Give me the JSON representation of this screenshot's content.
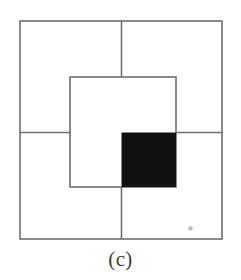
{
  "figure": {
    "caption": "(c)",
    "background_color": "#ffffff",
    "line_color": "#6e6e6e",
    "fill_color": "#111111",
    "dot_color": "#b8b8b8",
    "line_width": 1.6,
    "outer_square": {
      "name": "outer-square",
      "x": 20,
      "y": 21,
      "width": 202,
      "height": 218
    },
    "cross_lines": [
      {
        "name": "vertical-divider",
        "orientation": "vertical",
        "x": 121.5,
        "y1": 21,
        "y2": 239
      },
      {
        "name": "horizontal-divider",
        "orientation": "horizontal",
        "y": 132.5,
        "x1": 20,
        "x2": 222
      }
    ],
    "inner_square": {
      "name": "inner-square",
      "x": 70,
      "y": 77,
      "width": 106,
      "height": 110
    },
    "filled_square": {
      "name": "filled-square",
      "x": 121.5,
      "y": 132.5,
      "width": 54.5,
      "height": 54.5,
      "fill": "#111111"
    },
    "speck": {
      "name": "speck-mark",
      "cx": 190.5,
      "cy": 228.5,
      "r": 2.2
    }
  }
}
